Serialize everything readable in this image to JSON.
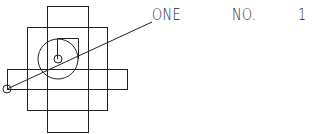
{
  "drawing": {
    "stroke_color": "#222222",
    "background": "#ffffff",
    "shapes": {
      "tall_rect": {
        "x": 47,
        "y": 6,
        "w": 41,
        "h": 126
      },
      "wide_rect": {
        "x": 27,
        "y": 27,
        "w": 80,
        "h": 83
      },
      "bar_rect": {
        "x": 7,
        "y": 69,
        "w": 120,
        "h": 20
      },
      "big_circle": {
        "cx": 58,
        "cy": 59,
        "r": 20
      },
      "small_square": {
        "x": 57,
        "y": 38,
        "w": 21,
        "h": 21
      },
      "center_point": {
        "cx": 58,
        "cy": 59,
        "r": 4
      },
      "anchor_point": {
        "cx": 7,
        "cy": 89,
        "r": 4
      },
      "leader_line": {
        "x1": 7,
        "y1": 89,
        "x2": 152,
        "y2": 22
      }
    }
  },
  "labels": {
    "name": "ONE",
    "number_label": "NO.",
    "number_value": "1"
  }
}
